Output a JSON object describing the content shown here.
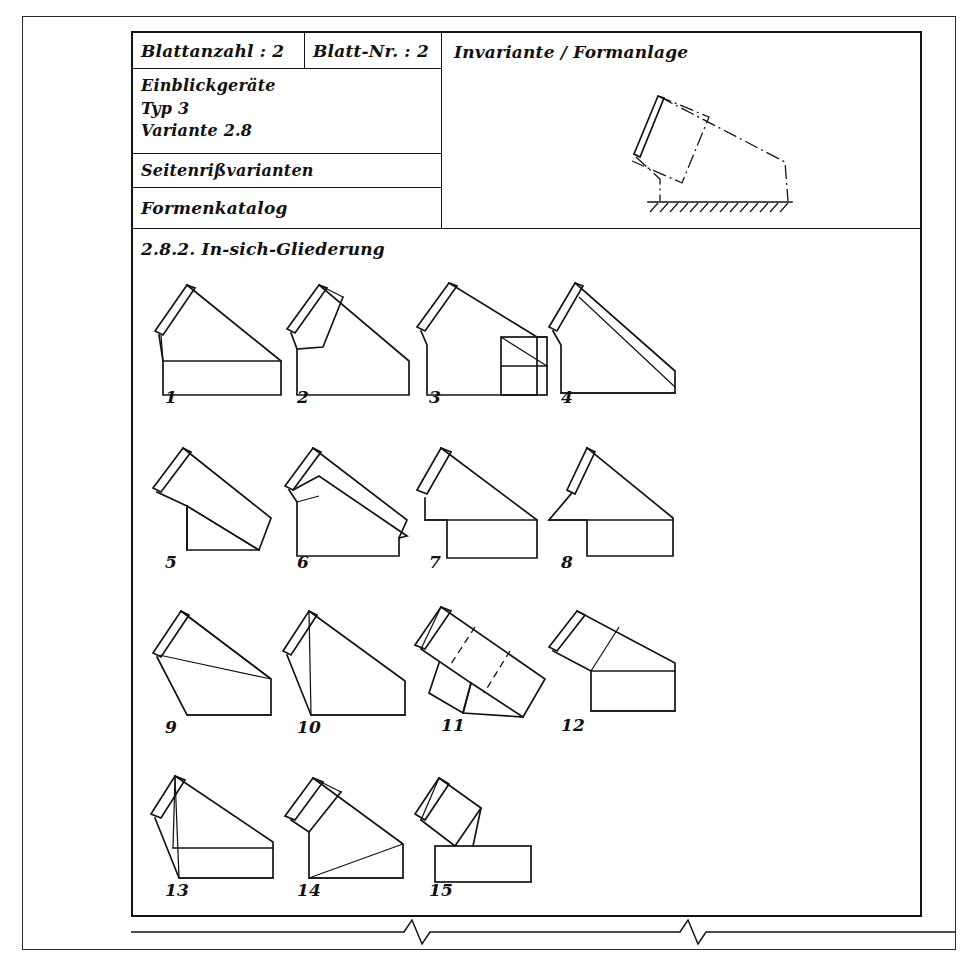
{
  "document": {
    "title_block": {
      "sheet_count_label": "Blattanzahl : 2",
      "sheet_number_label": "Blatt-Nr. : 2",
      "device_name": "Einblickgeräte",
      "device_type": "Typ 3",
      "device_variant": "Variante 2.8",
      "view_kind": "Seitenrißvarianten",
      "catalog_name": "Formenkatalog"
    },
    "right_panel": {
      "title": "Invariante / Formanlage"
    },
    "section": {
      "number": "2.8.2.",
      "title": "In-sich-Gliederung",
      "heading": "2.8.2. In-sich-Gliederung"
    },
    "figures": [
      {
        "label": "1",
        "caption": "1"
      },
      {
        "label": "2",
        "caption": "2"
      },
      {
        "label": "3",
        "caption": "3"
      },
      {
        "label": "4",
        "caption": "4"
      },
      {
        "label": "5",
        "caption": "5"
      },
      {
        "label": "6",
        "caption": "6"
      },
      {
        "label": "7",
        "caption": "7"
      },
      {
        "label": "8",
        "caption": "8"
      },
      {
        "label": "9",
        "caption": "9"
      },
      {
        "label": "10",
        "caption": "10"
      },
      {
        "label": "11",
        "caption": "11"
      },
      {
        "label": "12",
        "caption": "12"
      },
      {
        "label": "13",
        "caption": "13"
      },
      {
        "label": "14",
        "caption": "14"
      },
      {
        "label": "15",
        "caption": "15"
      }
    ],
    "colors": {
      "ink": "#141414",
      "paper": "#ffffff"
    }
  }
}
